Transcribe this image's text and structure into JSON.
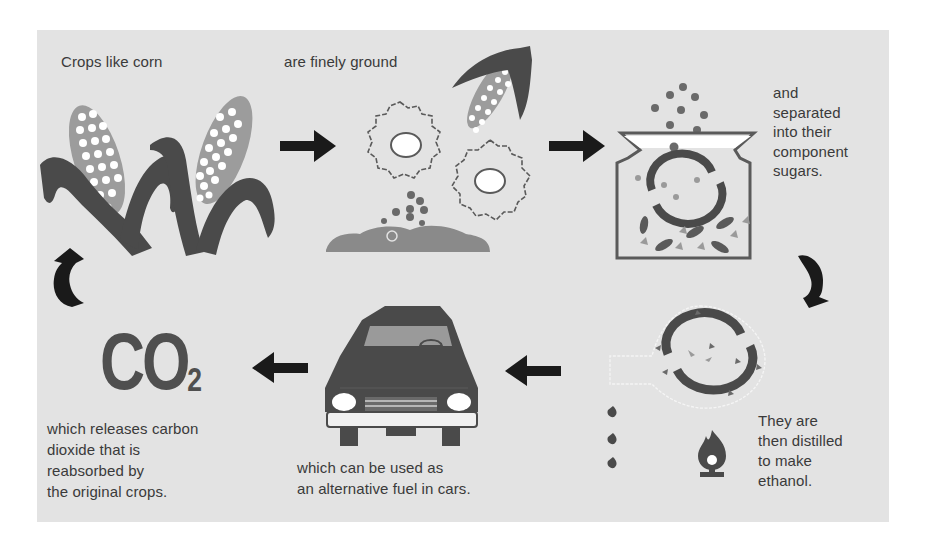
{
  "diagram": {
    "steps": [
      {
        "id": "crops",
        "label": "Crops like corn"
      },
      {
        "id": "ground",
        "label": "are finely ground"
      },
      {
        "id": "separated",
        "label": "and\nseparated\ninto their\ncomponent\nsugars."
      },
      {
        "id": "distilled",
        "label": "They are\nthen distilled\nto make\nethanol."
      },
      {
        "id": "fuel",
        "label": "which can be used as\nan alternative fuel in cars."
      },
      {
        "id": "co2",
        "label": "which releases carbon\ndioxide that is\nreabsorbed by\nthe original crops."
      }
    ],
    "co2_symbol": {
      "main": "CO",
      "subscript": "2"
    },
    "flow": [
      {
        "from": "crops",
        "to": "ground",
        "arrow": "right"
      },
      {
        "from": "ground",
        "to": "separated",
        "arrow": "right"
      },
      {
        "from": "separated",
        "to": "distilled",
        "arrow": "curved-down"
      },
      {
        "from": "distilled",
        "to": "fuel",
        "arrow": "left"
      },
      {
        "from": "fuel",
        "to": "co2",
        "arrow": "left"
      },
      {
        "from": "co2",
        "to": "crops",
        "arrow": "curved-up"
      }
    ]
  },
  "colors": {
    "background": "#e3e3e3",
    "dark_fill": "#4a4a4a",
    "arrow": "#1a1a1a",
    "kernel": "#ffffff",
    "mid_gray": "#9a9a9a",
    "text": "#3a3a3a"
  }
}
